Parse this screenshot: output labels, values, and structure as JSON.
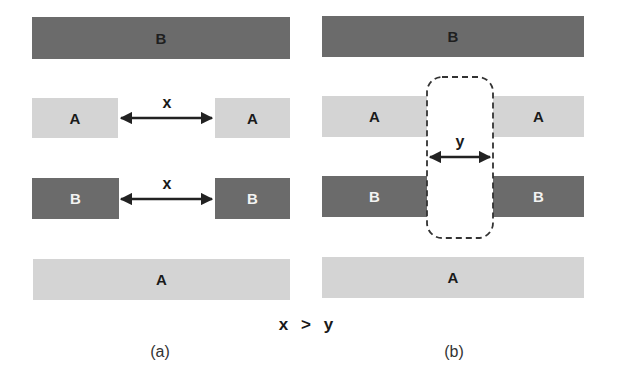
{
  "colors": {
    "layer_a": "#d4d4d4",
    "layer_b": "#6b6b6b",
    "arrow": "#222222",
    "dashed_outline": "#333333"
  },
  "panel_a": {
    "caption": "(a)",
    "layers": [
      {
        "label": "B",
        "type": "B",
        "continuous": true
      },
      {
        "label_left": "A",
        "label_right": "A",
        "type": "A",
        "gap_label": "x"
      },
      {
        "label_left": "B",
        "label_right": "B",
        "type": "B",
        "gap_label": "x"
      },
      {
        "label": "A",
        "type": "A",
        "continuous": true
      }
    ]
  },
  "panel_b": {
    "caption": "(b)",
    "layers": [
      {
        "label": "B",
        "type": "B",
        "continuous": true
      },
      {
        "label_left": "A",
        "label_right": "A",
        "type": "A"
      },
      {
        "label_left": "B",
        "label_right": "B",
        "type": "B"
      },
      {
        "label": "A",
        "type": "A",
        "continuous": true
      }
    ],
    "gap_label": "y",
    "highlight": "dashed-rounded-rectangle"
  },
  "relation": {
    "left": "x",
    "operator": ">",
    "right": "y"
  }
}
